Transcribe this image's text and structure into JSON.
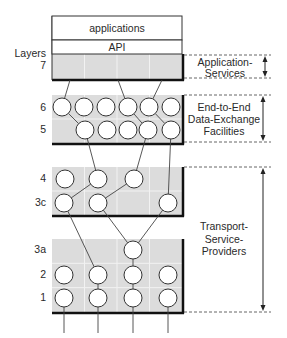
{
  "colors": {
    "block_fill": "#dcdcdc",
    "grid": "#f2f2f2",
    "border": "#111111",
    "line": "#444444",
    "circle_fill": "#ffffff",
    "circle_stroke": "#333333",
    "dash": "#555555",
    "text": "#2a2a2a"
  },
  "top_box": {
    "applications_label": "applications",
    "api_label": "API"
  },
  "left_labels": {
    "header": "Layers",
    "layers": [
      {
        "id": "7",
        "label": "7",
        "y": 69
      },
      {
        "id": "6",
        "label": "6",
        "y": 111
      },
      {
        "id": "5",
        "label": "5",
        "y": 133
      },
      {
        "id": "4",
        "label": "4",
        "y": 182
      },
      {
        "id": "3c",
        "label": "3c",
        "y": 206
      },
      {
        "id": "3a",
        "label": "3a",
        "y": 253
      },
      {
        "id": "2",
        "label": "2",
        "y": 278
      },
      {
        "id": "1",
        "label": "1",
        "y": 301
      }
    ]
  },
  "blocks": [
    {
      "id": "layer7",
      "x": 52,
      "y": 54,
      "w": 130,
      "h": 25
    },
    {
      "id": "layers6-5",
      "x": 52,
      "y": 95,
      "w": 130,
      "h": 48
    },
    {
      "id": "layers4-3c",
      "x": 52,
      "y": 167,
      "w": 130,
      "h": 48
    },
    {
      "id": "layers3a-1",
      "x": 52,
      "y": 239,
      "w": 130,
      "h": 73
    }
  ],
  "nodes": [
    {
      "id": "n6a",
      "layer": "6",
      "x": 62,
      "y": 107
    },
    {
      "id": "n6b",
      "layer": "6",
      "x": 84,
      "y": 107
    },
    {
      "id": "n6c",
      "layer": "6",
      "x": 106,
      "y": 107
    },
    {
      "id": "n6d",
      "layer": "6",
      "x": 128,
      "y": 107
    },
    {
      "id": "n6e",
      "layer": "6",
      "x": 149,
      "y": 107
    },
    {
      "id": "n6f",
      "layer": "6",
      "x": 171,
      "y": 107
    },
    {
      "id": "n5a",
      "layer": "5",
      "x": 85,
      "y": 130
    },
    {
      "id": "n5b",
      "layer": "5",
      "x": 107,
      "y": 130
    },
    {
      "id": "n5c",
      "layer": "5",
      "x": 128,
      "y": 130
    },
    {
      "id": "n5d",
      "layer": "5",
      "x": 148,
      "y": 130
    },
    {
      "id": "n5e",
      "layer": "5",
      "x": 171,
      "y": 130
    },
    {
      "id": "n4a",
      "layer": "4",
      "x": 65,
      "y": 179
    },
    {
      "id": "n4b",
      "layer": "4",
      "x": 98,
      "y": 179
    },
    {
      "id": "n4c",
      "layer": "4",
      "x": 134,
      "y": 179
    },
    {
      "id": "n3ca",
      "layer": "3c",
      "x": 64,
      "y": 203
    },
    {
      "id": "n3cb",
      "layer": "3c",
      "x": 98,
      "y": 203
    },
    {
      "id": "n3cc",
      "layer": "3c",
      "x": 168,
      "y": 203
    },
    {
      "id": "n3a",
      "layer": "3a",
      "x": 133,
      "y": 250
    },
    {
      "id": "n2a",
      "layer": "2",
      "x": 64,
      "y": 275
    },
    {
      "id": "n2b",
      "layer": "2",
      "x": 98,
      "y": 275
    },
    {
      "id": "n2c",
      "layer": "2",
      "x": 133,
      "y": 275
    },
    {
      "id": "n2d",
      "layer": "2",
      "x": 168,
      "y": 275
    },
    {
      "id": "n1a",
      "layer": "1",
      "x": 64,
      "y": 298
    },
    {
      "id": "n1b",
      "layer": "1",
      "x": 98,
      "y": 298
    },
    {
      "id": "n1c",
      "layer": "1",
      "x": 133,
      "y": 298
    },
    {
      "id": "n1d",
      "layer": "1",
      "x": 168,
      "y": 298
    }
  ],
  "edges": [
    {
      "from": [
        70,
        80
      ],
      "to": "n6a"
    },
    {
      "from": [
        118,
        80
      ],
      "to": "n6d"
    },
    {
      "from": [
        162,
        80
      ],
      "to": "n6e"
    },
    {
      "from": "n6a",
      "to": "n5a"
    },
    {
      "from": "n6d",
      "to": "n5d"
    },
    {
      "from": "n6e",
      "to": "n5e"
    },
    {
      "from": "n5a",
      "to": "n4b"
    },
    {
      "from": "n5d",
      "to": "n4c"
    },
    {
      "from": "n5e",
      "to": "n3cc"
    },
    {
      "from": "n4b",
      "to": "n3ca"
    },
    {
      "from": "n4c",
      "to": "n3cb"
    },
    {
      "from": "n3ca",
      "to": "n2b"
    },
    {
      "from": "n3cb",
      "to": "n3a"
    },
    {
      "from": "n3cc",
      "to": "n3a"
    },
    {
      "from": "n3a",
      "to": "n2c"
    },
    {
      "from": "n2b",
      "to": "n1b"
    },
    {
      "from": "n2c",
      "to": "n1c"
    },
    {
      "from": "n1a",
      "to": [
        64,
        333
      ]
    },
    {
      "from": "n1b",
      "to": [
        98,
        333
      ]
    },
    {
      "from": "n1c",
      "to": [
        133,
        333
      ]
    },
    {
      "from": "n1d",
      "to": [
        168,
        333
      ]
    }
  ],
  "brackets": [
    {
      "id": "application-services",
      "lines": [
        "Application-",
        "Services"
      ],
      "y_top": 55,
      "y_bottom": 78,
      "text_x": 225,
      "text_y": [
        66,
        77
      ],
      "arrow_x": 265
    },
    {
      "id": "end-to-end-data-exchange",
      "lines": [
        "End-to-End",
        "Data-Exchange",
        "Facilities"
      ],
      "y_top": 95,
      "y_bottom": 142,
      "text_x": 224,
      "text_y": [
        111,
        123,
        135
      ],
      "arrow_x": 263
    },
    {
      "id": "transport-service-providers",
      "lines": [
        "Transport-",
        "Service-",
        "Providers"
      ],
      "y_top": 167,
      "y_bottom": 312,
      "text_x": 224,
      "text_y": [
        230,
        243,
        255
      ],
      "arrow_x": 263
    }
  ]
}
